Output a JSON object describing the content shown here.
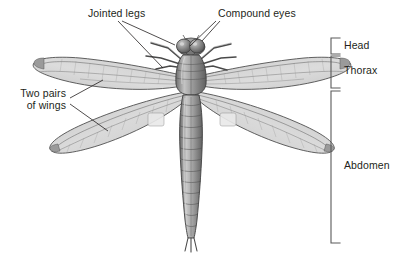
{
  "figure": {
    "view": "dorsal (top-down)",
    "style": "grayscale pencil / airbrush scientific illustration",
    "background_color": "#ffffff",
    "ink_color": "#231f20",
    "wing_fill_color": "#d8d8d8",
    "wing_shade_color": "#b9b9b9",
    "body_dark_color": "#5a5a5a",
    "body_mid_color": "#8d8d8d",
    "body_light_color": "#cfcfcf"
  },
  "callouts": [
    {
      "id": "jointed-legs",
      "text": "Jointed legs",
      "x": 88,
      "y": 8,
      "align": "left",
      "leader_lines": [
        {
          "from": [
            118,
            21
          ],
          "to": [
            163,
            68
          ]
        },
        {
          "from": [
            122,
            21
          ],
          "to": [
            175,
            45
          ]
        }
      ]
    },
    {
      "id": "compound-eyes",
      "text": "Compound eyes",
      "x": 218,
      "y": 8,
      "align": "left",
      "leader_lines": [
        {
          "from": [
            216,
            21
          ],
          "to": [
            190,
            46
          ]
        },
        {
          "from": [
            220,
            21
          ],
          "to": [
            202,
            41
          ]
        }
      ]
    },
    {
      "id": "two-pairs-of-wings",
      "line1": "Two pairs",
      "line2": "of wings",
      "x": 4,
      "y": 92,
      "align": "right",
      "leader_lines": [
        {
          "from": [
            70,
            98
          ],
          "to": [
            103,
            80
          ]
        },
        {
          "from": [
            70,
            104
          ],
          "to": [
            108,
            131
          ]
        }
      ]
    }
  ],
  "body_regions": {
    "bracket_x": 331,
    "tick_length": 9,
    "label_x": 344,
    "items": [
      {
        "id": "head",
        "label": "Head",
        "top": 38,
        "bottom": 54,
        "label_y": 41
      },
      {
        "id": "thorax",
        "label": "Thorax",
        "top": 54,
        "bottom": 90,
        "label_y": 66
      },
      {
        "id": "abdomen",
        "label": "Abdomen",
        "top": 90,
        "bottom": 243,
        "label_y": 161
      }
    ]
  }
}
